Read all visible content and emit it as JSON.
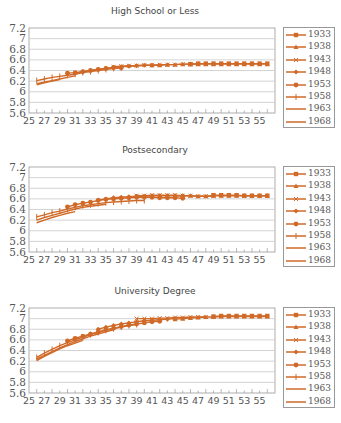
{
  "chart_data": [
    {
      "type": "line",
      "title": "High School or Less",
      "xlabel": "",
      "ylabel": "",
      "xlim": [
        25,
        57
      ],
      "ylim": [
        5.6,
        7.2
      ],
      "x_ticks": [
        "25",
        "27",
        "29",
        "31",
        "33",
        "35",
        "37",
        "39",
        "41",
        "43",
        "45",
        "47",
        "49",
        "51",
        "53",
        "55"
      ],
      "y_ticks": [
        "5.6",
        "5.8",
        "6",
        "6.2",
        "6.4",
        "6.6",
        "6.8",
        "7",
        "7.2"
      ],
      "grid": true,
      "legend_position": "right",
      "series": [
        {
          "name": "1933",
          "start": 46,
          "values": [
            6.52,
            6.53,
            6.53,
            6.53,
            6.53,
            6.53,
            6.53,
            6.53,
            6.53,
            6.53,
            6.53
          ]
        },
        {
          "name": "1938",
          "start": 41,
          "values": [
            6.5,
            6.5,
            6.51,
            6.51,
            6.52,
            6.52,
            6.52,
            6.52,
            6.52,
            6.52,
            6.52,
            6.52,
            6.52,
            6.52,
            6.52,
            6.52
          ]
        },
        {
          "name": "1943",
          "start": 36,
          "values": [
            6.47,
            6.48,
            6.49,
            6.49,
            6.5,
            6.5,
            6.51,
            6.51,
            6.51,
            6.52,
            6.52,
            6.52
          ]
        },
        {
          "name": "1948",
          "start": 31,
          "values": [
            6.35,
            6.37,
            6.4,
            6.42,
            6.44,
            6.46,
            6.47,
            6.48,
            6.49,
            6.5,
            6.5
          ]
        },
        {
          "name": "1953",
          "start": 30,
          "values": [
            6.35,
            6.36,
            6.38,
            6.4,
            6.42,
            6.44,
            6.45,
            6.45
          ]
        },
        {
          "name": "1958",
          "start": 26,
          "values": [
            6.21,
            6.24,
            6.27,
            6.29,
            6.31,
            6.33,
            6.36,
            6.38,
            6.4,
            6.42,
            6.44,
            6.45
          ]
        },
        {
          "name": "1963",
          "start": 26,
          "values": [
            6.15,
            6.18,
            6.21,
            6.24,
            6.27,
            6.3
          ]
        },
        {
          "name": "1968",
          "start": 26,
          "values": [
            6.13,
            6.17,
            6.2,
            6.23
          ]
        }
      ]
    },
    {
      "type": "line",
      "title": "Postsecondary",
      "xlabel": "",
      "ylabel": "",
      "xlim": [
        25,
        57
      ],
      "ylim": [
        5.6,
        7.2
      ],
      "x_ticks": [
        "25",
        "27",
        "29",
        "31",
        "33",
        "35",
        "37",
        "39",
        "41",
        "43",
        "45",
        "47",
        "49",
        "51",
        "53",
        "55"
      ],
      "y_ticks": [
        "5.6",
        "5.8",
        "6",
        "6.2",
        "6.4",
        "6.6",
        "6.8",
        "7",
        "7.2"
      ],
      "grid": true,
      "legend_position": "right",
      "series": [
        {
          "name": "1933",
          "start": 49,
          "values": [
            6.67,
            6.67,
            6.67,
            6.67,
            6.66,
            6.66,
            6.66,
            6.66
          ]
        },
        {
          "name": "1938",
          "start": 44,
          "values": [
            6.66,
            6.66,
            6.66,
            6.65,
            6.65,
            6.66,
            6.66,
            6.66,
            6.66,
            6.66,
            6.66,
            6.66,
            6.66
          ]
        },
        {
          "name": "1943",
          "start": 39,
          "values": [
            6.66,
            6.66,
            6.67,
            6.67,
            6.67,
            6.67,
            6.66,
            6.66,
            6.65,
            6.65,
            6.65
          ]
        },
        {
          "name": "1948",
          "start": 34,
          "values": [
            6.58,
            6.6,
            6.62,
            6.63,
            6.64,
            6.65,
            6.65,
            6.66,
            6.66,
            6.66,
            6.66,
            6.66
          ]
        },
        {
          "name": "1953",
          "start": 30,
          "values": [
            6.45,
            6.49,
            6.52,
            6.54,
            6.57,
            6.59,
            6.6,
            6.61,
            6.62,
            6.63,
            6.63,
            6.63,
            6.62,
            6.62,
            6.62,
            6.61
          ]
        },
        {
          "name": "1958",
          "start": 26,
          "values": [
            6.26,
            6.3,
            6.34,
            6.37,
            6.41,
            6.44,
            6.47,
            6.49,
            6.51,
            6.53,
            6.54,
            6.55,
            6.56,
            6.57,
            6.57
          ]
        },
        {
          "name": "1963",
          "start": 26,
          "values": [
            6.2,
            6.25,
            6.29,
            6.33,
            6.37,
            6.41,
            6.44,
            6.46,
            6.48,
            6.5
          ]
        },
        {
          "name": "1968",
          "start": 26,
          "values": [
            6.15,
            6.2,
            6.25,
            6.29,
            6.33,
            6.36
          ]
        }
      ]
    },
    {
      "type": "line",
      "title": "University Degree",
      "xlabel": "",
      "ylabel": "",
      "xlim": [
        25,
        57
      ],
      "ylim": [
        5.6,
        7.2
      ],
      "x_ticks": [
        "25",
        "27",
        "29",
        "31",
        "33",
        "35",
        "37",
        "39",
        "41",
        "43",
        "45",
        "47",
        "49",
        "51",
        "53",
        "55"
      ],
      "y_ticks": [
        "5.6",
        "5.8",
        "6",
        "6.2",
        "6.4",
        "6.6",
        "6.8",
        "7",
        "7.2"
      ],
      "grid": true,
      "legend_position": "right",
      "series": [
        {
          "name": "1933",
          "start": 49,
          "values": [
            7.04,
            7.05,
            7.05,
            7.05,
            7.05,
            7.05,
            7.05,
            7.05
          ]
        },
        {
          "name": "1938",
          "start": 44,
          "values": [
            6.99,
            7.0,
            7.01,
            7.02,
            7.03,
            7.03,
            7.04,
            7.04,
            7.04,
            7.04,
            7.04,
            7.04,
            7.04
          ]
        },
        {
          "name": "1943",
          "start": 39,
          "values": [
            7.0,
            7.0,
            7.0,
            7.01,
            7.01,
            7.02,
            7.02,
            7.03,
            7.03,
            7.03
          ]
        },
        {
          "name": "1948",
          "start": 34,
          "values": [
            6.8,
            6.84,
            6.87,
            6.9,
            6.92,
            6.94,
            6.96,
            6.97,
            6.98,
            6.99,
            7.0
          ]
        },
        {
          "name": "1953",
          "start": 30,
          "values": [
            6.58,
            6.63,
            6.67,
            6.71,
            6.75,
            6.79,
            6.82,
            6.85,
            6.88,
            6.9,
            6.92,
            6.94,
            6.95
          ]
        },
        {
          "name": "1958",
          "start": 26,
          "values": [
            6.27,
            6.35,
            6.42,
            6.49,
            6.55,
            6.6,
            6.65,
            6.7,
            6.74,
            6.78,
            6.81,
            6.84,
            6.87,
            6.89
          ]
        },
        {
          "name": "1963",
          "start": 26,
          "values": [
            6.24,
            6.31,
            6.38,
            6.45,
            6.51,
            6.57,
            6.62,
            6.67,
            6.71,
            6.75,
            6.79
          ]
        },
        {
          "name": "1968",
          "start": 26,
          "values": [
            6.21,
            6.29,
            6.36,
            6.43,
            6.49,
            6.54,
            6.59
          ]
        }
      ]
    }
  ],
  "style": {
    "line_color": "#d06a28",
    "grid_color": "#c8c8c8",
    "axis_color": "#999999",
    "text_color": "#555555"
  },
  "panels": [
    {
      "title": "High School or Less"
    },
    {
      "title": "Postsecondary"
    },
    {
      "title": "University Degree"
    }
  ],
  "legend": {
    "items": [
      {
        "label": "1933",
        "marker": "square"
      },
      {
        "label": "1938",
        "marker": "triangle"
      },
      {
        "label": "1943",
        "marker": "cross"
      },
      {
        "label": "1948",
        "marker": "diamond"
      },
      {
        "label": "1953",
        "marker": "circle"
      },
      {
        "label": "1958",
        "marker": "plus"
      },
      {
        "label": "1963",
        "marker": "none"
      },
      {
        "label": "1968",
        "marker": "none"
      }
    ]
  }
}
